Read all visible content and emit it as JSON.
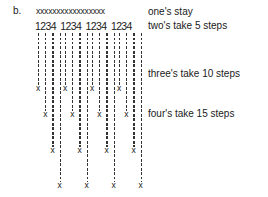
{
  "figure": {
    "label": "b.",
    "top_row": "xxxxxxxxxxxxxxxxx",
    "digit_groups": [
      "1234",
      "1234",
      "1234",
      "1234"
    ],
    "captions": [
      {
        "text": "one's stay",
        "top": 6
      },
      {
        "text": "two's take 5 steps",
        "top": 20
      },
      {
        "text": "three's take 10 steps",
        "top": 68
      },
      {
        "text": "four's take 15 steps",
        "top": 108
      }
    ],
    "end_marker": "x",
    "column_step_x": 7.2,
    "group_start_x": [
      36,
      63,
      90,
      117
    ],
    "column_end_y": [
      88,
      114,
      150,
      185
    ]
  }
}
